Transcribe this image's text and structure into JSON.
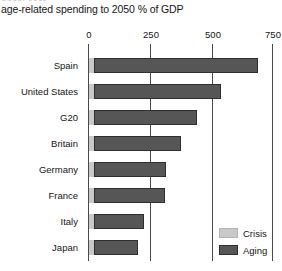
{
  "chart_data": {
    "type": "bar",
    "orientation": "horizontal",
    "stacked": true,
    "title": "age-related spending to 2050 % of GDP",
    "xlabel": "",
    "ylabel": "",
    "xlim": [
      0,
      750
    ],
    "grid": true,
    "legend_position": "bottom-right",
    "axis_ticks": [
      "0",
      "250",
      "500",
      "750"
    ],
    "axis_tick_values": [
      0,
      250,
      500,
      750
    ],
    "categories": [
      "Spain",
      "United States",
      "G20",
      "Britain",
      "Germany",
      "France",
      "Italy",
      "Japan"
    ],
    "series": [
      {
        "name": "Crisis",
        "color": "#c9c9c9",
        "values": [
          20,
          20,
          20,
          20,
          20,
          20,
          20,
          20
        ]
      },
      {
        "name": "Aging",
        "color": "#565656",
        "values": [
          670,
          520,
          420,
          355,
          295,
          290,
          205,
          180
        ]
      }
    ],
    "totals": [
      690,
      540,
      440,
      375,
      315,
      310,
      225,
      200
    ]
  },
  "legend": {
    "items": [
      {
        "label": "Crisis",
        "color": "#c9c9c9"
      },
      {
        "label": "Aging",
        "color": "#565656"
      }
    ]
  },
  "artifacts": {
    "clipped_top_text": "fiscal cost"
  }
}
